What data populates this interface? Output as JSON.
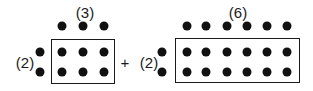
{
  "diagram": {
    "operator": "+",
    "arrays": [
      {
        "id": "left",
        "rows": 2,
        "cols": 3,
        "row_label": "(2)",
        "col_label": "(3)",
        "col_label_pos": [
          85,
          12
        ],
        "row_label_pos": [
          25,
          62
        ],
        "box": {
          "x": 51,
          "y": 39,
          "w": 64,
          "h": 45
        },
        "col_dots_x": [
          62,
          83,
          104
        ],
        "top_dot_y": 26,
        "row_dots_y": [
          52,
          72
        ],
        "left_dot_x": 40
      },
      {
        "id": "right",
        "rows": 2,
        "cols": 6,
        "row_label": "(2)",
        "col_label": "(6)",
        "col_label_pos": [
          238,
          12
        ],
        "row_label_pos": [
          149,
          62
        ],
        "box": {
          "x": 175,
          "y": 38,
          "w": 125,
          "h": 45
        },
        "col_dots_x": [
          187,
          206,
          227,
          247,
          267,
          287
        ],
        "top_dot_y": 26,
        "row_dots_y": [
          52,
          72
        ],
        "left_dot_x": 162
      }
    ],
    "operator_pos": [
      125,
      62
    ],
    "colors": {
      "ink": "#111111",
      "background": "#ffffff"
    }
  }
}
